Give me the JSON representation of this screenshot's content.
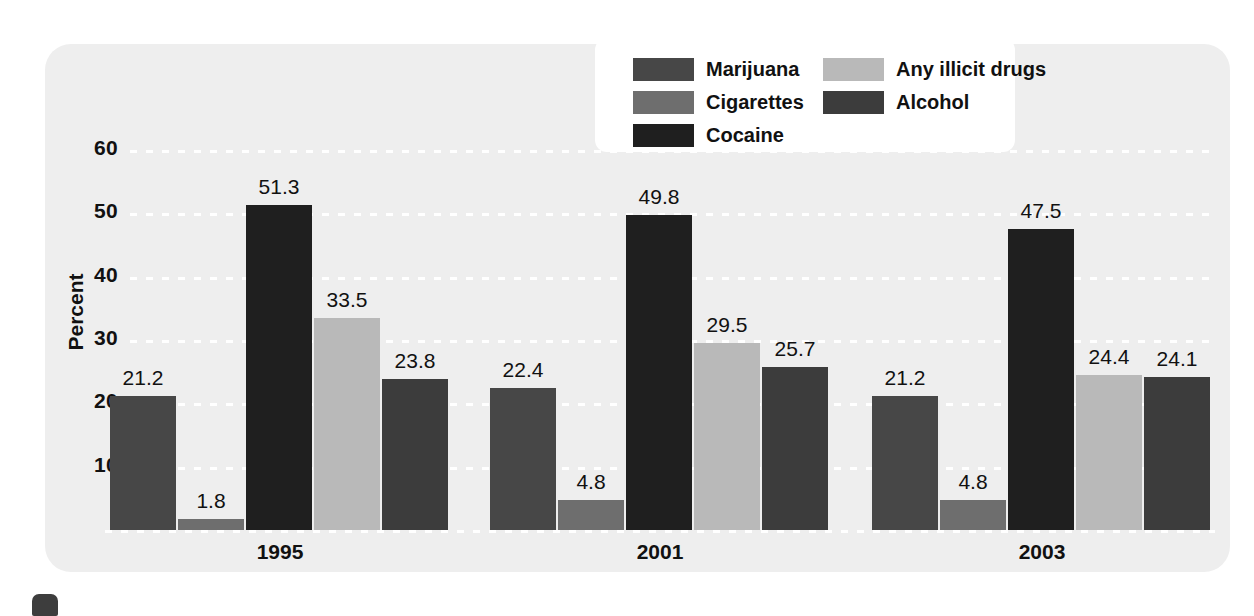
{
  "chart_data": {
    "type": "bar",
    "title": "",
    "xlabel": "",
    "ylabel": "Percent",
    "ylim": [
      0,
      60
    ],
    "yticks": [
      10,
      20,
      30,
      40,
      50,
      60
    ],
    "grid": true,
    "legend_position": "top-right",
    "categories": [
      "1995",
      "2001",
      "2003"
    ],
    "series": [
      {
        "name": "Marijuana",
        "color": "#474747",
        "values": [
          21.2,
          22.4,
          21.2
        ]
      },
      {
        "name": "Cigarettes",
        "color": "#6e6e6e",
        "values": [
          1.8,
          4.8,
          4.8
        ]
      },
      {
        "name": "Cocaine",
        "color": "#1f1f1f",
        "values": [
          51.3,
          49.8,
          47.5
        ]
      },
      {
        "name": "Any illicit drugs",
        "color": "#b9b9b9",
        "values": [
          33.5,
          29.5,
          24.4
        ]
      },
      {
        "name": "Alcohol",
        "color": "#3c3c3c",
        "values": [
          23.8,
          25.7,
          24.1
        ]
      }
    ]
  },
  "axis": {
    "y_label": "Percent",
    "y_ticks": [
      "60",
      "50",
      "40",
      "30",
      "20",
      "10"
    ],
    "group_labels": [
      "1995",
      "2001",
      "2003"
    ]
  },
  "legend": {
    "column_1": [
      {
        "label": "Marijuana",
        "color": "#474747"
      },
      {
        "label": "Cigarettes",
        "color": "#6e6e6e"
      },
      {
        "label": "Cocaine",
        "color": "#1f1f1f"
      }
    ],
    "column_2": [
      {
        "label": "Any illicit drugs",
        "color": "#b9b9b9"
      },
      {
        "label": "Alcohol",
        "color": "#3c3c3c"
      }
    ]
  },
  "values_1995": [
    "21.2",
    "1.8",
    "51.3",
    "33.5",
    "23.8"
  ],
  "values_2001": [
    "22.4",
    "4.8",
    "49.8",
    "29.5",
    "25.7"
  ],
  "values_2003": [
    "21.2",
    "4.8",
    "47.5",
    "24.4",
    "24.1"
  ],
  "colors": {
    "panel_background": "#eeeeee",
    "page_background": "#ffffff",
    "gridline": "#ffffff",
    "text": "#111111"
  }
}
